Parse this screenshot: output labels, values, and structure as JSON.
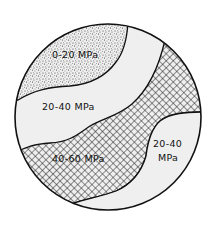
{
  "diagram": {
    "type": "stress-zone-map",
    "shape": "circle",
    "colors": {
      "background": "#ffffff",
      "region_fill": "#efefef",
      "outline": "#111111",
      "pattern_ink": "#222222"
    },
    "legend_patterns": {
      "stipple": "dotted",
      "crosshatch": "diagonal-grid",
      "plain": "none"
    },
    "regions": [
      {
        "id": "zone-top-left",
        "pattern": "stipple",
        "label": "0-20 MPa"
      },
      {
        "id": "zone-middle",
        "pattern": "plain",
        "label": "20-40 MPa"
      },
      {
        "id": "zone-band",
        "pattern": "crosshatch",
        "label": "40-60 MPa"
      },
      {
        "id": "zone-bottom-right",
        "pattern": "plain",
        "label_line1": "20-40",
        "label_line2": "MPa"
      }
    ]
  }
}
